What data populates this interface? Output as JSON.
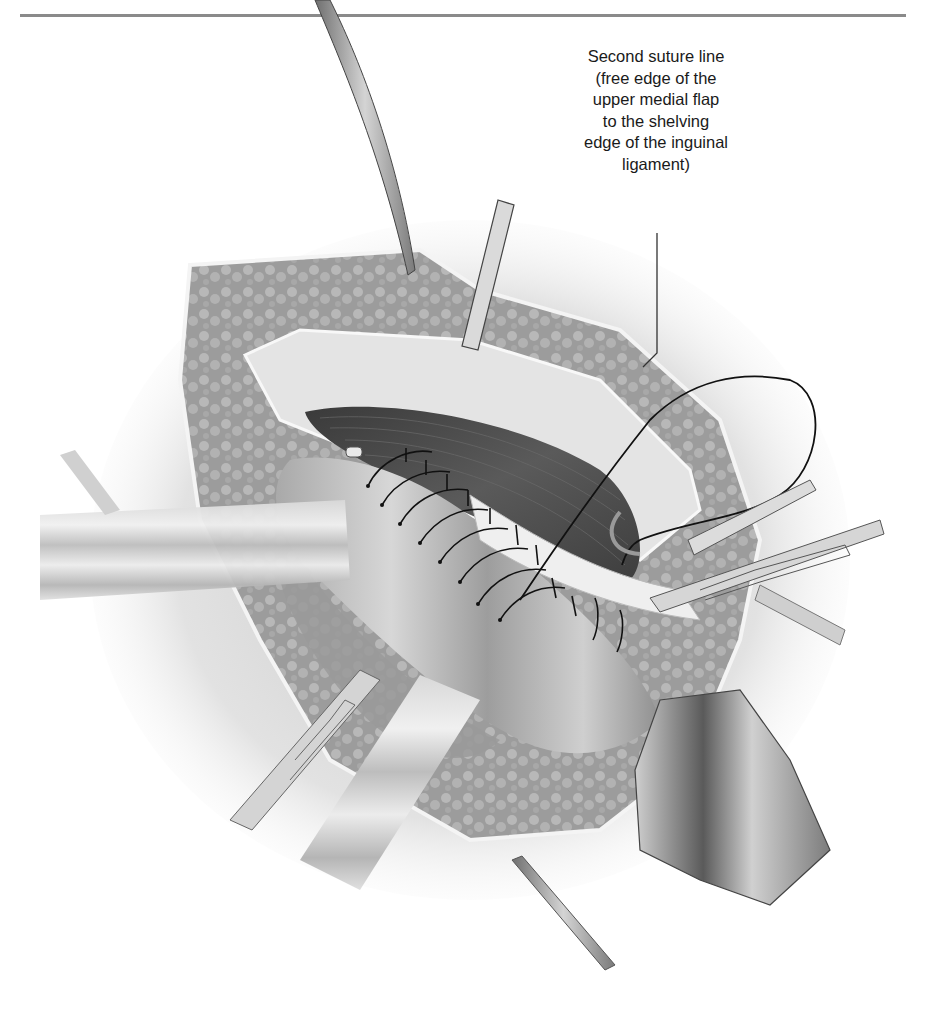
{
  "page": {
    "running_head": "",
    "page_number": ""
  },
  "figure": {
    "callout": {
      "lines": [
        "Second suture line",
        "(free edge of the",
        "upper medial flap",
        "to the shelving",
        "edge of the inguinal",
        "ligament)"
      ],
      "leader": {
        "x": 657,
        "y_start": 233,
        "y_bend": 353,
        "end_x": 643,
        "end_y": 367
      }
    },
    "elements": [
      "upper-left-retractor",
      "upper-center-retractor",
      "left-retractor-blade",
      "lower-left-forceps",
      "lower-center-retractor",
      "lower-retractor-tip",
      "right-forceps",
      "right-upper-retractor",
      "cord-retractor-band",
      "muscle-flap",
      "suture-line",
      "suture-loop"
    ],
    "colors": {
      "text": "#1a1a1a",
      "rule": "#8a8a8a",
      "fat": "#9a9a9a",
      "muscle": "#4a4a4a",
      "tissue": "#dcdcdc",
      "suture": "#111111"
    }
  }
}
